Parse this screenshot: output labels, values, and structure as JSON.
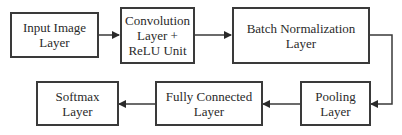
{
  "diagram": {
    "type": "flowchart",
    "nodes": [
      {
        "id": "input",
        "lines": [
          "Input Image",
          "Layer"
        ]
      },
      {
        "id": "conv",
        "lines": [
          "Convolution",
          "Layer +",
          "ReLU Unit"
        ]
      },
      {
        "id": "bn",
        "lines": [
          "Batch Normalization",
          "Layer"
        ]
      },
      {
        "id": "pool",
        "lines": [
          "Pooling",
          "Layer"
        ]
      },
      {
        "id": "fc",
        "lines": [
          "Fully Connected",
          "Layer"
        ]
      },
      {
        "id": "softmax",
        "lines": [
          "Softmax",
          "Layer"
        ]
      }
    ],
    "edges": [
      {
        "from": "input",
        "to": "conv"
      },
      {
        "from": "conv",
        "to": "bn"
      },
      {
        "from": "bn",
        "to": "pool"
      },
      {
        "from": "pool",
        "to": "fc"
      },
      {
        "from": "fc",
        "to": "softmax"
      }
    ],
    "colors": {
      "stroke": "#3a3a3a",
      "text": "#2a2a2a",
      "background": "#ffffff"
    }
  }
}
